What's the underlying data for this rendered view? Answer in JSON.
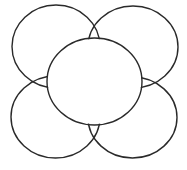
{
  "diagram": {
    "stroke_color": "#2a2a2a",
    "background": "#ffffff",
    "stroke_width": 1.4,
    "center": {
      "cx": 94.5,
      "cy": 81.5,
      "rx": 47.5,
      "ry": 43.5
    },
    "lobes": [
      {
        "name": "top-left",
        "cx": 56,
        "cy": 46.5,
        "rx": 44,
        "ry": 41.5
      },
      {
        "name": "top-right",
        "cx": 133,
        "cy": 47,
        "rx": 45,
        "ry": 41
      },
      {
        "name": "bottom-left",
        "cx": 55.5,
        "cy": 117,
        "rx": 44.5,
        "ry": 41
      },
      {
        "name": "bottom-right",
        "cx": 132.5,
        "cy": 117.5,
        "rx": 44.5,
        "ry": 40.5
      }
    ]
  }
}
